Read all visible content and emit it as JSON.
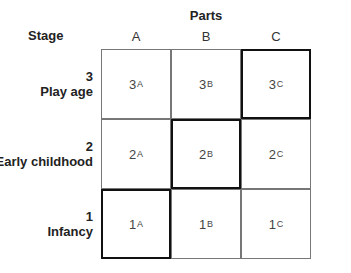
{
  "header": {
    "parts_title": "Parts",
    "stage_title": "Stage",
    "columns": [
      "A",
      "B",
      "C"
    ]
  },
  "rows": [
    {
      "number": "3",
      "label": "Play age",
      "cells": [
        {
          "main": "3",
          "sub": "A"
        },
        {
          "main": "3",
          "sub": "B"
        },
        {
          "main": "3",
          "sub": "C"
        }
      ]
    },
    {
      "number": "2",
      "label": "Early childhood",
      "cells": [
        {
          "main": "2",
          "sub": "A"
        },
        {
          "main": "2",
          "sub": "B"
        },
        {
          "main": "2",
          "sub": "C"
        }
      ]
    },
    {
      "number": "1",
      "label": "Infancy",
      "cells": [
        {
          "main": "1",
          "sub": "A"
        },
        {
          "main": "1",
          "sub": "B"
        },
        {
          "main": "1",
          "sub": "C"
        }
      ]
    }
  ],
  "highlighted_cells": [
    "3C",
    "2B",
    "1A"
  ],
  "colors": {
    "grid_line": "#777777",
    "highlight_border": "#111111"
  }
}
